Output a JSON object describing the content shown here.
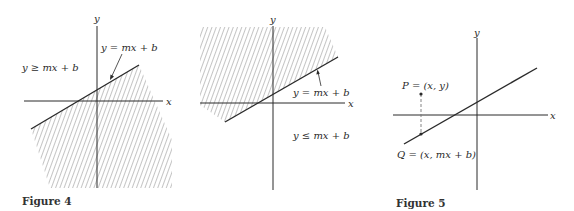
{
  "figures": [
    {
      "caption": "Figure 4",
      "panels": [
        {
          "axis_x_label": "x",
          "axis_y_label": "y",
          "line_label": "y = mx + b",
          "region_label": "y ≥ mx + b",
          "shaded_side": "below line"
        },
        {
          "axis_x_label": "x",
          "axis_y_label": "y",
          "line_label": "y = mx + b",
          "region_label": "y ≤ mx + b",
          "shaded_side": "above line"
        }
      ]
    },
    {
      "caption": "Figure 5",
      "axis_x_label": "x",
      "axis_y_label": "y",
      "point_p_label": "P = (x, y)",
      "point_q_label": "Q = (x, mx + b)"
    }
  ],
  "colors": {
    "ink": "#2a2a2a",
    "hatch": "#8a8a8a"
  }
}
